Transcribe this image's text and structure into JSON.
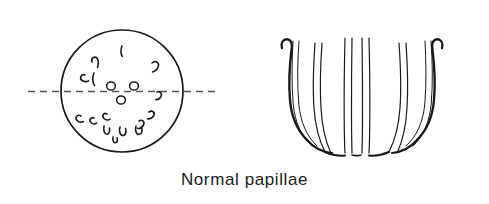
{
  "figure": {
    "caption": "Normal papillae",
    "background_color": "#ffffff",
    "ink_color": "#1a1a1a",
    "dash_color": "#555555",
    "width": 489,
    "height": 204,
    "panels": [
      {
        "name": "frontal-view",
        "description": "Circular outline with scattered papillae marks and a horizontal dashed midline",
        "circle": {
          "cx": 122,
          "cy": 91,
          "r": 61
        },
        "midline": {
          "x1": 28,
          "y1": 91,
          "x2": 217,
          "y2": 91,
          "dash": "7 5"
        },
        "papillae_count": 17
      },
      {
        "name": "profile-view",
        "description": "Side view of calyces drawn as paired curved vertical lines forming a cup with a central gap",
        "bounds": {
          "x": 272,
          "y": 35,
          "width": 196,
          "height": 120
        }
      }
    ]
  }
}
